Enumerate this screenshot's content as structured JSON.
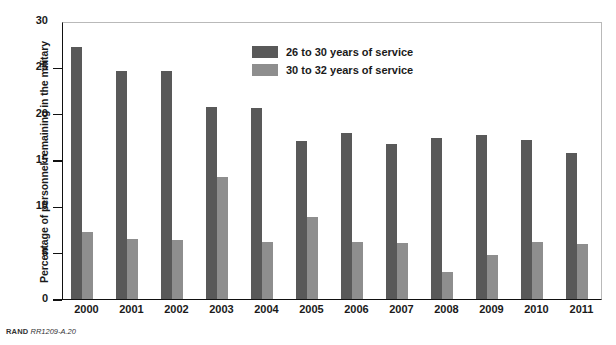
{
  "chart_data": {
    "type": "bar",
    "title": "",
    "xlabel": "",
    "ylabel": "Percentage of personnel remaining in the military",
    "ylim": [
      0,
      30
    ],
    "yticks": [
      0,
      5,
      10,
      15,
      20,
      25,
      30
    ],
    "grid": false,
    "legend_position": "top-center",
    "categories": [
      "2000",
      "2001",
      "2002",
      "2003",
      "2004",
      "2005",
      "2006",
      "2007",
      "2008",
      "2009",
      "2010",
      "2011"
    ],
    "series": [
      {
        "name": "26 to 30 years of service",
        "color": "#595959",
        "values": [
          27.2,
          24.6,
          24.6,
          20.7,
          20.6,
          17.1,
          17.9,
          16.7,
          17.4,
          17.7,
          17.2,
          15.8
        ]
      },
      {
        "name": "30 to 32 years of service",
        "color": "#8e8e8e",
        "values": [
          7.2,
          6.5,
          6.4,
          13.2,
          6.2,
          8.9,
          6.2,
          6.0,
          2.9,
          4.8,
          6.1,
          5.9
        ]
      }
    ]
  },
  "footnote": {
    "org": "RAND",
    "code": "RR1209-A.20"
  }
}
